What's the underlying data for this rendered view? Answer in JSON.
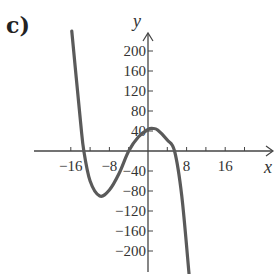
{
  "panel_label": "c)",
  "chart_data": {
    "type": "line",
    "title": "",
    "xlabel": "x",
    "ylabel": "y",
    "x_ticks": [
      -16,
      -8,
      8,
      16
    ],
    "x_tick_labels": [
      "−16",
      "−8",
      "8",
      "16"
    ],
    "x_minor_tick_step": 4,
    "y_ticks": [
      200,
      160,
      120,
      80,
      40,
      -40,
      -80,
      -120,
      -160,
      -200
    ],
    "y_tick_labels": [
      "200",
      "160",
      "120",
      "80",
      "40",
      "−40",
      "−80",
      "−120",
      "−160",
      "−200"
    ],
    "xlim": [
      -20,
      20
    ],
    "ylim": [
      -250,
      250
    ],
    "grid": false,
    "legend": null,
    "series": [
      {
        "name": "cubic",
        "description": "Cubic with negative leading coefficient: local min near (-10, -90), local max near (1, 45); x-intercepts near -13.3, -4, 5.5",
        "x": [
          -15.8,
          -14,
          -13.3,
          -12,
          -10,
          -8,
          -6,
          -4,
          -2,
          0,
          1,
          2,
          4,
          5.5,
          7,
          8.5
        ],
        "y": [
          240,
          60,
          0,
          -60,
          -90,
          -78,
          -45,
          0,
          28,
          43,
          45,
          42,
          22,
          0,
          -90,
          -245
        ]
      }
    ]
  }
}
